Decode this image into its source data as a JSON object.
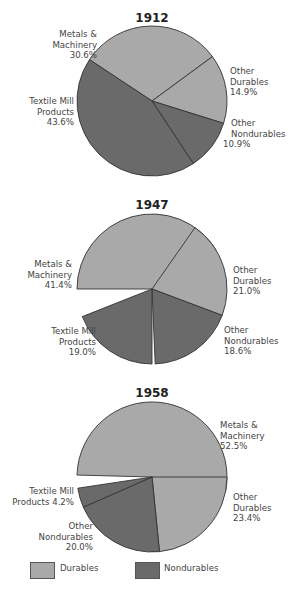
{
  "chart_data": [
    {
      "type": "pie",
      "title": "1912",
      "slices": [
        {
          "label": "Metals & Machinery",
          "value": 30.6,
          "group": "Durables"
        },
        {
          "label": "Other Durables",
          "value": 14.9,
          "group": "Durables"
        },
        {
          "label": "Other Nondurables",
          "value": 10.9,
          "group": "Nondurables"
        },
        {
          "label": "Textile Mill Products",
          "value": 43.6,
          "group": "Nondurables"
        }
      ]
    },
    {
      "type": "pie",
      "title": "1947",
      "slices": [
        {
          "label": "Metals & Machinery",
          "value": 41.4,
          "group": "Durables"
        },
        {
          "label": "Other Durables",
          "value": 21.0,
          "group": "Durables"
        },
        {
          "label": "Other Nondurables",
          "value": 18.6,
          "group": "Nondurables"
        },
        {
          "label": "Textile Mill Products",
          "value": 19.0,
          "group": "Nondurables"
        }
      ]
    },
    {
      "type": "pie",
      "title": "1958",
      "slices": [
        {
          "label": "Metals & Machinery",
          "value": 52.5,
          "group": "Durables"
        },
        {
          "label": "Other Durables",
          "value": 23.4,
          "group": "Durables"
        },
        {
          "label": "Other Nondurables",
          "value": 20.0,
          "group": "Nondurables"
        },
        {
          "label": "Textile Mill Products",
          "value": 4.2,
          "group": "Nondurables"
        }
      ]
    }
  ],
  "legend": [
    {
      "label": "Durables",
      "color": "#a9a9a9"
    },
    {
      "label": "Nondurables",
      "color": "#6a6a6a"
    }
  ],
  "colors": {
    "durables": "#a9a9a9",
    "nondurables": "#6a6a6a",
    "stroke": "#333333"
  },
  "pies": [
    {
      "title": "1912",
      "cx": 152,
      "cy": 101,
      "r": 75,
      "title_y": 22,
      "segments": [
        {
          "start": 303.5,
          "value": 30.6,
          "group": "d"
        },
        {
          "start": 53.7,
          "value": 14.9,
          "group": "d"
        },
        {
          "start": 107.3,
          "value": 10.9,
          "group": "n"
        },
        {
          "start": 146.5,
          "value": 43.6,
          "group": "n"
        }
      ],
      "labels": [
        {
          "lines": [
            "Metals &",
            "Machinery",
            "30.6%"
          ],
          "x": 97,
          "y": 37,
          "anchor": "end"
        },
        {
          "lines": [
            "Other",
            "Durables",
            "14.9%"
          ],
          "x": 230,
          "y": 74,
          "anchor": "start"
        },
        {
          "lines": [
            "Textile Mill",
            "Products",
            "43.6%"
          ],
          "x": 74,
          "y": 104,
          "anchor": "end"
        },
        {
          "lines": [
            "Other",
            "Nondurables",
            "10.9%"
          ],
          "x": 231,
          "y": 126,
          "anchor": "start",
          "last_offset": -8
        }
      ]
    },
    {
      "title": "1947",
      "cx": 152,
      "cy": 289,
      "r": 75,
      "title_y": 209,
      "segments": [
        {
          "start": 270.0,
          "value": 41.4,
          "group": "d"
        },
        {
          "start": 35.0,
          "value": 21.0,
          "group": "d"
        },
        {
          "start": 110.6,
          "value": 18.6,
          "group": "n"
        },
        {
          "start": 180.0,
          "value": 19.0,
          "group": "n"
        }
      ],
      "labels": [
        {
          "lines": [
            "Metals &",
            "Machinery",
            "41.4%"
          ],
          "x": 72,
          "y": 267,
          "anchor": "end"
        },
        {
          "lines": [
            "Other",
            "Durables",
            "21.0%"
          ],
          "x": 233,
          "y": 273,
          "anchor": "start"
        },
        {
          "lines": [
            "Textile Mill",
            "Products",
            "19.0%"
          ],
          "x": 96,
          "y": 334,
          "anchor": "end"
        },
        {
          "lines": [
            "Other",
            "Nondurables",
            "18.6%"
          ],
          "x": 224,
          "y": 333,
          "anchor": "start"
        }
      ]
    },
    {
      "title": "1958",
      "cx": 152,
      "cy": 477,
      "r": 75,
      "title_y": 397,
      "segments": [
        {
          "start": 271.5,
          "value": 52.5,
          "group": "d"
        },
        {
          "start": 90.0,
          "value": 23.4,
          "group": "d"
        },
        {
          "start": 174.3,
          "value": 20.0,
          "group": "n"
        },
        {
          "start": 246.3,
          "value": 4.2,
          "group": "n"
        }
      ],
      "labels": [
        {
          "lines": [
            "Metals &",
            "Machinery",
            "52.5%"
          ],
          "x": 220,
          "y": 428,
          "anchor": "start"
        },
        {
          "lines": [
            "Textile Mill",
            "Products 4.2%"
          ],
          "x": 74,
          "y": 494,
          "anchor": "end"
        },
        {
          "lines": [
            "Other",
            "Durables",
            "23.4%"
          ],
          "x": 233,
          "y": 500,
          "anchor": "start"
        },
        {
          "lines": [
            "Other",
            "Nondurables",
            "20.0%"
          ],
          "x": 93,
          "y": 529,
          "anchor": "end"
        }
      ]
    }
  ]
}
